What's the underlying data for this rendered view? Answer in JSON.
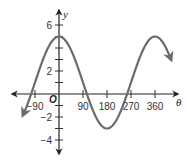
{
  "chart_data": {
    "type": "line",
    "title": "",
    "xlabel": "θ",
    "ylabel": "y",
    "origin_label": "O",
    "function": "y = 1 + 4cos(θ)",
    "xlim": [
      -135,
      420
    ],
    "ylim": [
      -5,
      7
    ],
    "x_ticks": [
      -90,
      90,
      180,
      270,
      360
    ],
    "x_tick_labels": [
      "−90",
      "90",
      "180",
      "270",
      "360"
    ],
    "y_ticks": [
      -4,
      -3,
      -2,
      -1,
      1,
      2,
      3,
      4,
      5,
      6
    ],
    "y_tick_labels": [
      {
        "value": 6,
        "label": "6"
      },
      {
        "value": 2,
        "label": "2"
      },
      {
        "value": -2,
        "label": "−2"
      },
      {
        "value": -4,
        "label": "−4"
      }
    ],
    "grid": false,
    "series": [
      {
        "name": "curve",
        "color": "#6b6b6b",
        "x": [
          -135,
          -90,
          0,
          90,
          180,
          270,
          360,
          420
        ],
        "y": [
          -1.83,
          1,
          5,
          1,
          -3,
          1,
          5,
          2.8
        ]
      }
    ],
    "annotations": [
      "arrowheads at both ends of curve",
      "arrowheads on both axes"
    ]
  },
  "labels": {
    "x_axis": "θ",
    "y_axis": "y",
    "origin": "O",
    "xt_m90": "−90",
    "xt_90": "90",
    "xt_180": "180",
    "xt_270": "270",
    "xt_360": "360",
    "yt_6": "6",
    "yt_2": "2",
    "yt_m2": "−2",
    "yt_m4": "−4"
  }
}
